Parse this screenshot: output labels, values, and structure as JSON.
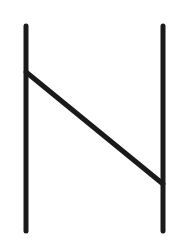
{
  "figure": {
    "stroke_color": "#1a1a1a",
    "background": "#ffffff",
    "stroke_width": 5,
    "lines": [
      {
        "name": "left-vertical",
        "x1": 26,
        "y1": 26,
        "x2": 26,
        "y2": 231
      },
      {
        "name": "right-vertical",
        "x1": 163,
        "y1": 26,
        "x2": 163,
        "y2": 231
      },
      {
        "name": "diagonal",
        "x1": 26,
        "y1": 72,
        "x2": 163,
        "y2": 184
      }
    ]
  }
}
